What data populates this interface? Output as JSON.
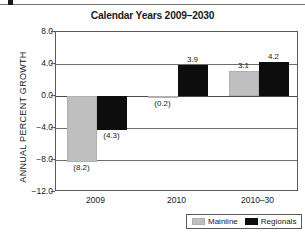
{
  "chart_data": {
    "type": "bar",
    "title": "Calendar Years 2009–2030",
    "xlabel": "",
    "ylabel": "ANNUAL PERCENT GROWTH",
    "categories": [
      "2009",
      "2010",
      "2010–30"
    ],
    "series": [
      {
        "name": "Mainline",
        "color": "#bfbfbf",
        "values": [
          -8.2,
          -0.2,
          3.1
        ],
        "labels": [
          "(8.2)",
          "(0.2)",
          "3.1"
        ]
      },
      {
        "name": "Regionals",
        "color": "#0d0d0d",
        "values": [
          -4.3,
          3.9,
          4.2
        ],
        "labels": [
          "(4.3)",
          "3.9",
          "4.2"
        ]
      }
    ],
    "ylim": [
      -12.0,
      8.0
    ],
    "yticks": [
      8.0,
      4.0,
      0.0,
      -4.0,
      -8.0,
      -12.0
    ],
    "ytick_labels": [
      "8.0",
      "4.0",
      "0.0",
      "−4.0",
      "−8.0",
      "−12.0"
    ],
    "grid": true,
    "legend_position": "bottom-right"
  },
  "legend": {
    "items": [
      {
        "label": "Mainline"
      },
      {
        "label": "Regionals"
      }
    ]
  }
}
